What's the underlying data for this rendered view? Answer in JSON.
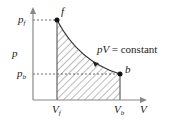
{
  "diagram": {
    "type": "p-V diagram",
    "axes": {
      "y_label": "p",
      "x_label": "V"
    },
    "points": [
      {
        "name": "f",
        "x_tick": "V",
        "x_tick_sub": "f",
        "y_tick": "p",
        "y_tick_sub": "f"
      },
      {
        "name": "b",
        "x_tick": "V",
        "x_tick_sub": "b",
        "y_tick": "p",
        "y_tick_sub": "b"
      }
    ],
    "curve_label": {
      "lhs": "pV",
      "rhs": "= constant"
    },
    "colors": {
      "line": "#333333",
      "axis": "#888888",
      "hatch": "#555555"
    }
  }
}
